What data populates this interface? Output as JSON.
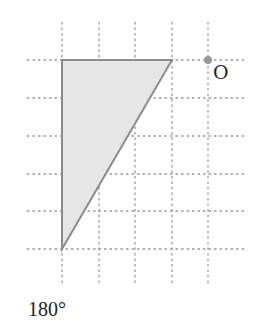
{
  "figure": {
    "grid": {
      "x_lines": [
        62,
        99,
        135,
        172,
        208
      ],
      "y_lines": [
        60,
        98,
        136,
        174,
        211,
        249
      ],
      "x_extent": [
        27,
        246
      ],
      "y_extent": [
        22,
        286
      ],
      "line_color": "#9a9a9a"
    },
    "shape": {
      "type": "right-triangle",
      "vertices": [
        [
          62,
          60
        ],
        [
          172,
          60
        ],
        [
          62,
          249
        ]
      ],
      "fill": "#e6e6e6",
      "stroke": "#8c8c8c"
    },
    "center_point": {
      "label": "O",
      "x": 208,
      "y": 60,
      "color": "#999999"
    },
    "rotation_caption": "180°"
  }
}
